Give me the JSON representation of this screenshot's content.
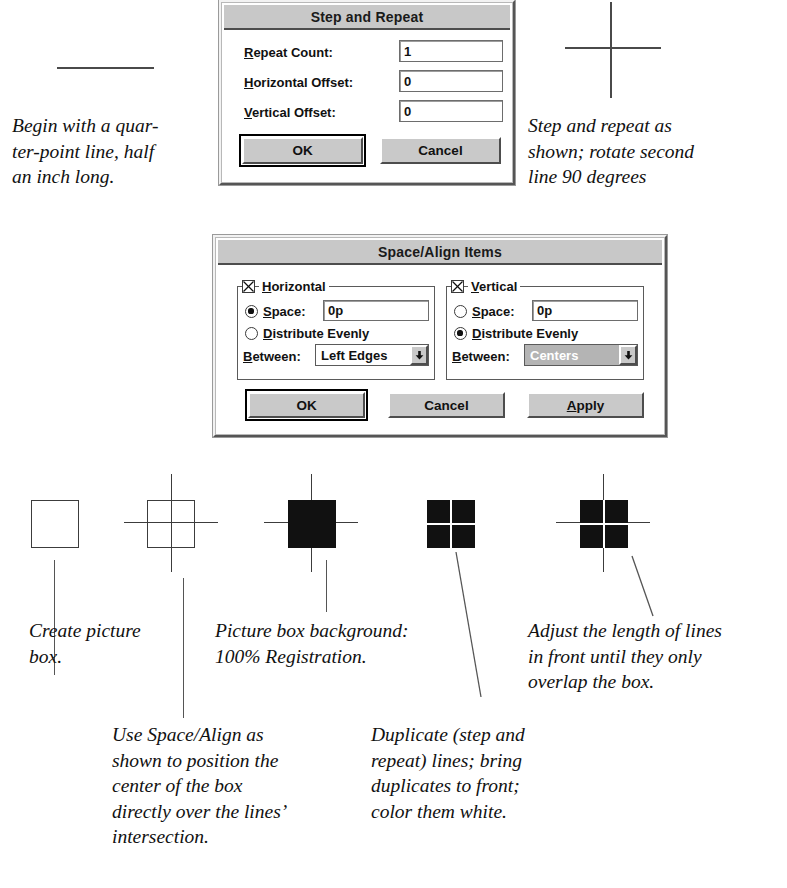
{
  "page": {
    "width": 787,
    "height": 888,
    "background": "#ffffff",
    "ink": "#111111"
  },
  "top_art": {
    "quarter_point_line_label": "horizontal-quarter-point-line",
    "crosshair_label": "step-and-repeat-crosshair"
  },
  "dialog_step_repeat": {
    "title": "Step and Repeat",
    "fields": [
      {
        "label": "Repeat Count:",
        "accel": "R",
        "value": "1"
      },
      {
        "label": "Horizontal Offset:",
        "accel": "H",
        "value": "0"
      },
      {
        "label": "Vertical Offset:",
        "accel": "V",
        "value": "0"
      }
    ],
    "buttons": [
      {
        "label": "OK",
        "default": true
      },
      {
        "label": "Cancel",
        "default": false
      }
    ]
  },
  "dialog_space_align": {
    "title": "Space/Align Items",
    "groups": [
      {
        "name": "Horizontal",
        "accel": "H",
        "checked": true,
        "space_label": "Space:",
        "space_accel": "S",
        "space_selected": true,
        "space_value": "0p",
        "distribute_label": "Distribute Evenly",
        "distribute_accel": "D",
        "distribute_selected": false,
        "between_label": "Between:",
        "between_accel": "B",
        "between_value": "Left Edges",
        "between_disabled": false
      },
      {
        "name": "Vertical",
        "accel": "V",
        "checked": true,
        "space_label": "Space:",
        "space_accel": "S",
        "space_selected": false,
        "space_value": "0p",
        "distribute_label": "Distribute Evenly",
        "distribute_accel": "D",
        "distribute_selected": true,
        "between_label": "Between:",
        "between_accel": "B",
        "between_value": "Centers",
        "between_disabled": true
      }
    ],
    "buttons": [
      {
        "label": "OK",
        "default": true
      },
      {
        "label": "Cancel",
        "default": false
      },
      {
        "label": "Apply",
        "accel": "A",
        "default": false
      }
    ]
  },
  "captions": {
    "begin_line": "Begin with a quar-\nter-point line, half\nan inch long.",
    "step_repeat_as_shown": "Step and repeat as\nshown; rotate second\nline 90 degrees",
    "create_picture_box": "Create picture\nbox.",
    "picture_box_background": "Picture box background:\n100% Registration.",
    "adjust_length": "Adjust the length of lines\nin front until they only\noverlap the box.",
    "use_space_align": "Use Space/Align as\nshown to position the\ncenter of the box\ndirectly over the lines’\nintersection.",
    "duplicate_lines": "Duplicate (step and\nrepeat) lines; bring\nduplicates to front;\ncolor them white."
  },
  "figures": [
    {
      "id": "figure-1",
      "name": "empty-picture-box",
      "style": "outline-box"
    },
    {
      "id": "figure-2",
      "name": "box-over-crosshair",
      "style": "outline-box-with-crosshair"
    },
    {
      "id": "figure-3",
      "name": "black-box-with-crosshair",
      "style": "solid-box-with-crosshair"
    },
    {
      "id": "figure-4",
      "name": "black-box-white-cross",
      "style": "solid-box-white-cross"
    },
    {
      "id": "figure-5",
      "name": "black-box-white-cross-with-arms",
      "style": "solid-box-white-cross-with-arms"
    }
  ]
}
